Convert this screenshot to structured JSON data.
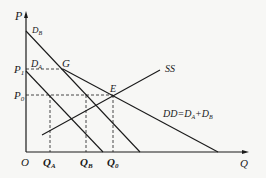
{
  "diagram": {
    "type": "supply-demand",
    "axes": {
      "y_label": "P",
      "x_label": "Q",
      "origin_label": "O"
    },
    "price_levels": [
      {
        "id": "P1",
        "label": "P",
        "sub": "1"
      },
      {
        "id": "P0",
        "label": "P",
        "sub": "0"
      }
    ],
    "quantity_levels": [
      {
        "id": "QA",
        "label": "Q",
        "sub": "A"
      },
      {
        "id": "QB",
        "label": "Q",
        "sub": "B"
      },
      {
        "id": "Q0",
        "label": "Q",
        "sub": "0"
      }
    ],
    "curves": {
      "DB": {
        "label": "D",
        "sub": "B"
      },
      "DA": {
        "label": "D",
        "sub": "A"
      },
      "SS": {
        "label": "SS"
      },
      "DD": {
        "label": "DD=D",
        "sub1": "A",
        "plus": "+D",
        "sub2": "B"
      }
    },
    "points": {
      "G": {
        "label": "G"
      },
      "E": {
        "label": "E"
      }
    },
    "colors": {
      "line": "#1a1a1a",
      "background": "#f7f7f5"
    }
  }
}
